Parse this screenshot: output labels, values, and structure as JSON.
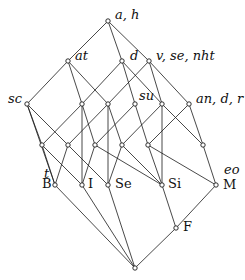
{
  "diagram": {
    "type": "concept-lattice",
    "colors": {
      "line": "#1a1a1a",
      "node_fill": "#ffffff",
      "text": "#111111"
    },
    "nodes": [
      {
        "id": "top",
        "x": 108,
        "y": 21
      },
      {
        "id": "at",
        "x": 68,
        "y": 61
      },
      {
        "id": "d",
        "x": 122,
        "y": 61
      },
      {
        "id": "v",
        "x": 149,
        "y": 61
      },
      {
        "id": "sc",
        "x": 27,
        "y": 104
      },
      {
        "id": "n82",
        "x": 82,
        "y": 104
      },
      {
        "id": "n108",
        "x": 108,
        "y": 104
      },
      {
        "id": "su",
        "x": 135,
        "y": 104
      },
      {
        "id": "n162",
        "x": 162,
        "y": 104
      },
      {
        "id": "an",
        "x": 189,
        "y": 104
      },
      {
        "id": "r4a",
        "x": 42,
        "y": 145
      },
      {
        "id": "r4b",
        "x": 68,
        "y": 145
      },
      {
        "id": "r4c",
        "x": 95,
        "y": 145
      },
      {
        "id": "r4e",
        "x": 122,
        "y": 145
      },
      {
        "id": "r4f",
        "x": 148,
        "y": 145
      },
      {
        "id": "r4g",
        "x": 203,
        "y": 145
      },
      {
        "id": "B",
        "x": 55,
        "y": 185
      },
      {
        "id": "I",
        "x": 82,
        "y": 185
      },
      {
        "id": "Se",
        "x": 108,
        "y": 185
      },
      {
        "id": "Si",
        "x": 162,
        "y": 185
      },
      {
        "id": "M",
        "x": 216,
        "y": 185
      },
      {
        "id": "F",
        "x": 176,
        "y": 228
      },
      {
        "id": "bottom",
        "x": 135,
        "y": 268
      }
    ],
    "edges": [
      [
        "top",
        "at"
      ],
      [
        "top",
        "d"
      ],
      [
        "top",
        "v"
      ],
      [
        "at",
        "sc"
      ],
      [
        "at",
        "n82"
      ],
      [
        "at",
        "n108"
      ],
      [
        "d",
        "n82"
      ],
      [
        "d",
        "su"
      ],
      [
        "d",
        "n162"
      ],
      [
        "v",
        "n108"
      ],
      [
        "v",
        "n162"
      ],
      [
        "v",
        "an"
      ],
      [
        "sc",
        "r4a"
      ],
      [
        "sc",
        "r4b"
      ],
      [
        "sc",
        "B"
      ],
      [
        "n82",
        "r4a"
      ],
      [
        "n82",
        "r4c"
      ],
      [
        "n82",
        "I"
      ],
      [
        "n108",
        "r4b"
      ],
      [
        "n108",
        "r4e"
      ],
      [
        "n108",
        "Se"
      ],
      [
        "su",
        "r4c"
      ],
      [
        "su",
        "r4f"
      ],
      [
        "n162",
        "r4e"
      ],
      [
        "n162",
        "r4g"
      ],
      [
        "n162",
        "Si"
      ],
      [
        "an",
        "r4f"
      ],
      [
        "an",
        "r4g"
      ],
      [
        "r4a",
        "B"
      ],
      [
        "r4a",
        "I"
      ],
      [
        "r4b",
        "B"
      ],
      [
        "r4b",
        "Se"
      ],
      [
        "r4c",
        "I"
      ],
      [
        "r4c",
        "Si"
      ],
      [
        "r4e",
        "Se"
      ],
      [
        "r4e",
        "Si"
      ],
      [
        "r4f",
        "Si"
      ],
      [
        "r4f",
        "M"
      ],
      [
        "r4g",
        "M"
      ],
      [
        "B",
        "bottom"
      ],
      [
        "I",
        "bottom"
      ],
      [
        "Se",
        "bottom"
      ],
      [
        "Si",
        "F"
      ],
      [
        "M",
        "F"
      ],
      [
        "F",
        "bottom"
      ]
    ],
    "labels": {
      "top": {
        "text": "a, h",
        "x": 115,
        "y": 8,
        "italic": true
      },
      "at": {
        "text": "at",
        "x": 75,
        "y": 49,
        "italic": true
      },
      "d": {
        "text": "d",
        "x": 130,
        "y": 49,
        "italic": true
      },
      "v": {
        "text": "v, se, nht",
        "x": 156,
        "y": 49,
        "italic": true
      },
      "sc": {
        "text": "sc",
        "x": 8,
        "y": 92,
        "italic": true
      },
      "su": {
        "text": "su",
        "x": 139,
        "y": 89,
        "italic": true
      },
      "an": {
        "text": "an, d, r",
        "x": 196,
        "y": 92,
        "italic": true
      },
      "t": {
        "text": "t",
        "x": 44,
        "y": 167,
        "italic": true
      },
      "B": {
        "text": "B",
        "x": 42,
        "y": 177,
        "italic": false
      },
      "I": {
        "text": "I",
        "x": 88,
        "y": 177,
        "italic": false
      },
      "Se": {
        "text": "Se",
        "x": 115,
        "y": 177,
        "italic": false
      },
      "Si": {
        "text": "Si",
        "x": 168,
        "y": 177,
        "italic": false
      },
      "eo": {
        "text": "eo",
        "x": 224,
        "y": 163,
        "italic": true
      },
      "M": {
        "text": "M",
        "x": 223,
        "y": 178,
        "italic": false
      },
      "F": {
        "text": "F",
        "x": 183,
        "y": 220,
        "italic": false
      }
    }
  }
}
